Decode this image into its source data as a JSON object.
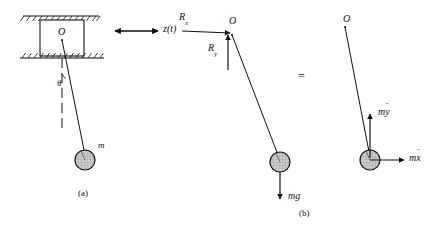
{
  "figure": {
    "captions": {
      "a": "(a)",
      "b": "(b)"
    },
    "equals_sign": "=",
    "panel_a": {
      "pivot_label": "O",
      "displacement_label": "z(t)",
      "angle_label": "θ",
      "mass_label": "m",
      "hatching": "fixed-guide-hatching"
    },
    "panel_b_free_body": {
      "pivot_label": "O",
      "reaction_x_label": "R",
      "reaction_x_subscript": "x",
      "reaction_y_label": "R",
      "reaction_y_subscript": "y",
      "weight_label": "mg"
    },
    "panel_b_kinetic": {
      "pivot_label": "O",
      "vertical_inertia_base": "my",
      "vertical_inertia_dots": "¨",
      "vertical_inertia_m": "m",
      "vertical_inertia_var": "y",
      "horizontal_inertia_m": "m",
      "horizontal_inertia_var": "x"
    },
    "colors": {
      "ink": "#111111",
      "bob_fill": "#c9c9c9",
      "rule": "#1a1a1a"
    }
  }
}
